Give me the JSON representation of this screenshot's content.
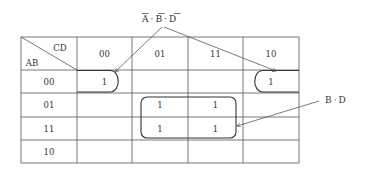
{
  "diagram": {
    "type": "karnaugh-map",
    "corner": {
      "col_var": "CD",
      "row_var": "AB"
    },
    "col_headers": [
      "00",
      "01",
      "11",
      "10"
    ],
    "row_headers": [
      "00",
      "01",
      "11",
      "10"
    ],
    "cells": [
      [
        "1",
        "",
        "",
        "1"
      ],
      [
        "",
        "1",
        "1",
        ""
      ],
      [
        "",
        "1",
        "1",
        ""
      ],
      [
        "",
        "",
        "",
        ""
      ]
    ],
    "groups": [
      {
        "name": "wraparound-group",
        "term_parts": [
          "A",
          "B",
          "D"
        ],
        "term_separator": "·",
        "negated": [
          true,
          true,
          true
        ],
        "cells": [
          "00-00",
          "00-10"
        ]
      },
      {
        "name": "center-group",
        "term_parts": [
          "B",
          "D"
        ],
        "term_separator": "·",
        "negated": [
          false,
          false
        ],
        "cells": [
          "01-01",
          "01-11",
          "11-01",
          "11-11"
        ]
      }
    ],
    "labels": {
      "top_term": {
        "A": "A",
        "dot1": "·",
        "B": "B",
        "dot2": "·",
        "D": "D"
      },
      "right_term": {
        "B": "B",
        "dot": "·",
        "D": "D"
      }
    }
  }
}
